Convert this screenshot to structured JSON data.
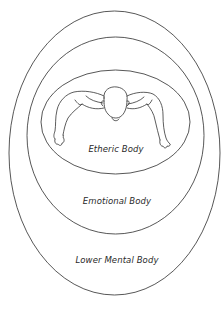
{
  "diagram": {
    "type": "nested-ellipses",
    "stroke_color": "#444444",
    "layers": [
      {
        "id": "lower-mental",
        "label": "Lower Mental Body",
        "cx": 114.5,
        "cy": 153,
        "rx": 105.5,
        "ry": 142
      },
      {
        "id": "emotional",
        "label": "Emotional Body",
        "cx": 115.5,
        "cy": 135.5,
        "rx": 88.5,
        "ry": 98.5
      },
      {
        "id": "etheric",
        "label": "Etheric Body",
        "cx": 115.5,
        "cy": 122,
        "rx": 74.5,
        "ry": 52
      }
    ],
    "center_figure": "human-figure-top-view"
  }
}
